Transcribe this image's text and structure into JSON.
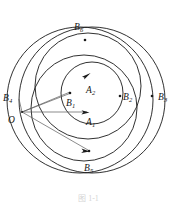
{
  "figure": {
    "type": "geometric-diagram",
    "caption": "图 1-1",
    "background_color": "#ffffff",
    "stroke_color": "#1a1a1a",
    "ray_color": "#555555",
    "labels": [
      {
        "id": "B6",
        "base": "B",
        "sub": "6",
        "x": 74,
        "y": 23
      },
      {
        "id": "B4",
        "base": "B",
        "sub": "4",
        "x": 3,
        "y": 94
      },
      {
        "id": "O",
        "base": "O",
        "sub": "",
        "x": 8,
        "y": 116
      },
      {
        "id": "B1",
        "base": "B",
        "sub": "1",
        "x": 66,
        "y": 99
      },
      {
        "id": "A2",
        "base": "A",
        "sub": "2",
        "x": 86,
        "y": 86
      },
      {
        "id": "A1",
        "base": "A",
        "sub": "1",
        "x": 86,
        "y": 118
      },
      {
        "id": "B2",
        "base": "B",
        "sub": "2",
        "x": 123,
        "y": 93
      },
      {
        "id": "B3",
        "base": "B",
        "sub": "3",
        "x": 158,
        "y": 93
      },
      {
        "id": "B5",
        "base": "B",
        "sub": "5",
        "x": 84,
        "y": 164
      }
    ],
    "circles": [
      {
        "id": "outer-left-large",
        "cx": 80,
        "cy": 100,
        "r": 73
      },
      {
        "id": "outer-right-large",
        "cx": 92,
        "cy": 100,
        "r": 73
      },
      {
        "id": "middle-upper",
        "cx": 88,
        "cy": 86,
        "r": 53
      },
      {
        "id": "middle-lower",
        "cx": 84,
        "cy": 108,
        "r": 53
      },
      {
        "id": "inner-small",
        "cx": 92,
        "cy": 93,
        "r": 31
      }
    ],
    "vertex": {
      "id": "O",
      "x": 22,
      "y": 112
    },
    "rays": [
      {
        "from": "O",
        "to_x": 70,
        "to_y": 93,
        "label": "ray-to-B1"
      },
      {
        "from": "O",
        "to_x": 86,
        "to_y": 112,
        "label": "ray-to-A1"
      },
      {
        "from": "O",
        "to_x": 88,
        "to_y": 151,
        "label": "ray-to-B5"
      },
      {
        "from": "O",
        "to_x": 20,
        "to_y": 100,
        "label": "ray-to-B4"
      }
    ],
    "arrow_markers": [
      {
        "id": "arrow-A2-top",
        "x": 88,
        "y": 74,
        "angle": 20
      },
      {
        "id": "arrow-A1-bot",
        "x": 86,
        "y": 112,
        "angle": 0
      },
      {
        "id": "arrow-B5-bot",
        "x": 89,
        "y": 151,
        "angle": 5
      }
    ],
    "point_dots": [
      {
        "id": "dot-B6",
        "x": 85,
        "y": 40
      },
      {
        "id": "dot-B1",
        "x": 70,
        "y": 93
      },
      {
        "id": "dot-B2",
        "x": 120,
        "y": 96
      },
      {
        "id": "dot-B3",
        "x": 152,
        "y": 96
      },
      {
        "id": "dot-B5",
        "x": 89,
        "y": 151
      }
    ]
  }
}
